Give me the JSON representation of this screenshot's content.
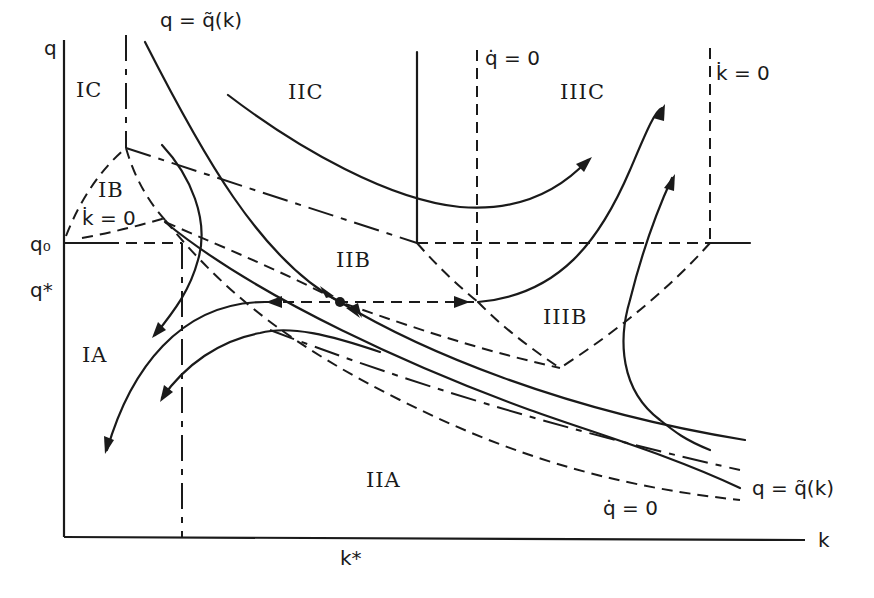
{
  "axes": {
    "y_label": "q",
    "x_label": "k",
    "q0_label": "q₀",
    "qstar_label": "q*",
    "kstar_label": "k*"
  },
  "regions": {
    "IC": "IC",
    "IB": "IB",
    "IA": "IA",
    "IIC": "IIC",
    "IIB": "IIB",
    "IIA": "IIA",
    "IIIC": "IIIC",
    "IIIB": "IIIB"
  },
  "curve_labels": {
    "qtilde_top": "q = q̃(k)",
    "qtilde_right": "q = q̃(k)",
    "qdot_top": "q̇ = 0",
    "qdot_bottom": "q̇ = 0",
    "kdot_top": "k̇ = 0",
    "kdot_left": "k̇ = 0"
  },
  "colors": {
    "ink": "#1a1a1a",
    "background": "#ffffff"
  },
  "equilibrium_point": {
    "x": 340,
    "y": 302
  }
}
